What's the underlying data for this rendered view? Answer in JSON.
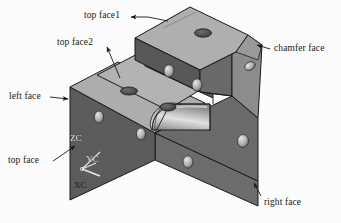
{
  "figure": {
    "type": "isometric-cad-solid-model",
    "title": "",
    "background_color": "#fdfdfd",
    "line_color": "#1a1a1a"
  },
  "palette": {
    "top_face_light": "#b4b4b4",
    "top_face_mid": "#a8a8a8",
    "front_face_dark": "#5e5e5e",
    "right_face_mid": "#6d6d6d",
    "chamfer_face": "#8a8a8a",
    "fillet_highlight": "#d8d8d8",
    "fillet_shadow": "#7a7a7a",
    "hole_dark": "#3a3a3a",
    "hole_light": "#c8c8c8",
    "outline": "#1a1a1a"
  },
  "labels": [
    {
      "id": "top-face1",
      "text": "top face1",
      "x": 84,
      "y": 12
    },
    {
      "id": "top-face2",
      "text": "top face2",
      "x": 58,
      "y": 40
    },
    {
      "id": "chamfer-face",
      "text": "chamfer face",
      "x": 274,
      "y": 46
    },
    {
      "id": "left-face",
      "text": "left face",
      "x": 9,
      "y": 94
    },
    {
      "id": "top-face",
      "text": "top face",
      "x": 8,
      "y": 159
    },
    {
      "id": "right-face",
      "text": "right face",
      "x": 264,
      "y": 200
    }
  ],
  "leaders": [
    {
      "id": "leader-top-face1",
      "from": [
        132,
        16
      ],
      "to": [
        152,
        22
      ],
      "arrow": "left"
    },
    {
      "id": "leader-top-face2",
      "from": [
        104,
        45
      ],
      "to": [
        119,
        80
      ],
      "arrow": "up"
    },
    {
      "id": "leader-chamfer-face",
      "from": [
        272,
        50
      ],
      "to": [
        256,
        44
      ],
      "arrow": "left"
    },
    {
      "id": "leader-left-face",
      "from": [
        50,
        97
      ],
      "to": [
        70,
        100
      ],
      "arrow": "right"
    },
    {
      "id": "leader-top-face",
      "from": [
        52,
        160
      ],
      "to": [
        75,
        146
      ],
      "arrow": "up-right"
    },
    {
      "id": "leader-right-face",
      "from": [
        262,
        197
      ],
      "to": [
        254,
        184
      ],
      "arrow": "up"
    }
  ],
  "axis_triad": {
    "origin": [
      82,
      170
    ],
    "axes": [
      {
        "id": "zc-axis",
        "label": "ZC",
        "label_x": 70,
        "label_y": 137,
        "color": "#f0f0f0"
      },
      {
        "id": "yc-axis",
        "label": "YC",
        "label_x": 86,
        "label_y": 157,
        "color": "#f0f0f0"
      },
      {
        "id": "xc-axis",
        "label": "XC",
        "label_x": 75,
        "label_y": 183,
        "color": "#1a1a1a"
      }
    ]
  },
  "geometry": {
    "faces": [
      {
        "id": "top-face1",
        "name": "top face1",
        "shade": "#b2b2b2",
        "note": "upper block top surface"
      },
      {
        "id": "top-face2",
        "name": "top face2",
        "shade": "#b0b0b0",
        "note": "mid step shelf surface"
      },
      {
        "id": "top-face",
        "name": "top face",
        "shade": "#aaaaaa",
        "note": "lower left step surface"
      },
      {
        "id": "left-face",
        "name": "left face",
        "shade": "#5c5c5c",
        "note": "front-left vertical wall"
      },
      {
        "id": "right-face",
        "name": "right face",
        "shade": "#6c6c6c",
        "note": "front-right vertical wall"
      },
      {
        "id": "chamfer-face",
        "name": "chamfer face",
        "shade": "#8e8e8e",
        "note": "angled corner cut"
      },
      {
        "id": "fillet-face",
        "name": "fillet",
        "shade": "#cfcfcf",
        "note": "rounded internal corner"
      }
    ],
    "holes": [
      {
        "id": "hole-top1-a",
        "face": "top face1",
        "cx": 203,
        "cy": 33,
        "rx": 8.5,
        "ry": 4.2,
        "style": "ellipse-dark"
      },
      {
        "id": "hole-top2-a",
        "face": "top face2",
        "cx": 129,
        "cy": 91,
        "rx": 8.5,
        "ry": 4.0,
        "style": "ellipse-dark"
      },
      {
        "id": "hole-top2-b",
        "face": "top face2",
        "cx": 168,
        "cy": 107,
        "rx": 8.0,
        "ry": 4.0,
        "style": "ellipse-dark"
      },
      {
        "id": "hole-front-a",
        "face": "front upper",
        "cx": 169,
        "cy": 71,
        "rx": 5.0,
        "ry": 6.2,
        "style": "ellipse-light"
      },
      {
        "id": "hole-front-b",
        "face": "front upper",
        "cx": 197,
        "cy": 85,
        "rx": 5.0,
        "ry": 6.2,
        "style": "ellipse-light"
      },
      {
        "id": "hole-chamfer-a",
        "face": "chamfer face",
        "cx": 250,
        "cy": 66,
        "rx": 5.5,
        "ry": 4.0,
        "style": "ellipse-light"
      },
      {
        "id": "hole-left-a",
        "face": "left face",
        "cx": 99,
        "cy": 117,
        "rx": 4.6,
        "ry": 6.0,
        "style": "ellipse-light"
      },
      {
        "id": "hole-left-b",
        "face": "left face",
        "cx": 141,
        "cy": 134,
        "rx": 4.6,
        "ry": 6.0,
        "style": "ellipse-light"
      },
      {
        "id": "hole-right-a",
        "face": "right face",
        "cx": 243,
        "cy": 141,
        "rx": 5.5,
        "ry": 6.5,
        "style": "ellipse-light"
      },
      {
        "id": "hole-right-b",
        "face": "right face",
        "cx": 188,
        "cy": 162,
        "rx": 5.0,
        "ry": 6.2,
        "style": "ellipse-light"
      }
    ]
  }
}
